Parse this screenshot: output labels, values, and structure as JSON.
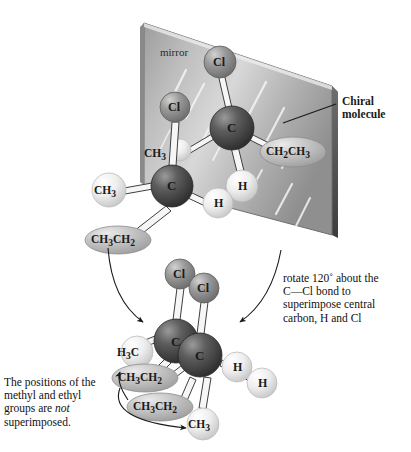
{
  "figure": {
    "mirror_label": "mirror",
    "chiral_label_line1": "Chiral",
    "chiral_label_line2": "molecule"
  },
  "annotations": {
    "rotate_note": "rotate 120˚ about the\nC—Cl bond to\nsuperimpose central\ncarbon, H and Cl",
    "not_superimposed_pre": "The positions of the\nmethyl and ethyl\ngroups are ",
    "not_superimposed_ital": "not",
    "not_superimposed_post": "\nsuperimposed."
  },
  "colors": {
    "carbon": "#4a4a4a",
    "carbon_light": "#8f8f8f",
    "chlorine": "#8a8a8a",
    "chlorine_light": "#c9c9c9",
    "hydrogen": "#e9e9e9",
    "hydrogen_light": "#ffffff",
    "group_ellipse": "#b6b6b6",
    "group_ellipse_light": "#e2e2e2",
    "mirror_dark": "#8d8d8d",
    "mirror_light": "#dcdcdc",
    "mirror_edge": "#4f4f4f",
    "bond": "#f2f2f2",
    "bond_outline": "#4a4a4a",
    "text": "#1a1a1a"
  },
  "top_molecule_left": {
    "name": "left-enantiomer",
    "atoms": [
      {
        "id": "cl",
        "label": "Cl",
        "kind": "chlorine",
        "cx": 175,
        "cy": 107,
        "r": 15
      },
      {
        "id": "c",
        "label": "C",
        "kind": "carbon",
        "cx": 172,
        "cy": 186,
        "r": 21
      },
      {
        "id": "ch3",
        "label": "CH3",
        "kind": "hydrogen",
        "cx": 109,
        "cy": 190,
        "r": 17
      },
      {
        "id": "h",
        "label": "H",
        "kind": "hydrogen",
        "cx": 218,
        "cy": 203,
        "r": 15
      }
    ],
    "groups": [
      {
        "id": "ch3-upper",
        "label": "CH3",
        "cx": 158,
        "cy": 153
      },
      {
        "id": "ch3ch2",
        "label": "CH3CH2",
        "cx": 118,
        "cy": 240
      }
    ]
  },
  "top_molecule_right": {
    "name": "right-enantiomer",
    "atoms": [
      {
        "id": "cl",
        "label": "Cl",
        "kind": "chlorine",
        "cx": 220,
        "cy": 62,
        "r": 16
      },
      {
        "id": "c",
        "label": "C",
        "kind": "carbon",
        "cx": 232,
        "cy": 128,
        "r": 22
      },
      {
        "id": "h",
        "label": "H",
        "kind": "hydrogen",
        "cx": 242,
        "cy": 186,
        "r": 16
      }
    ],
    "groups": [
      {
        "id": "ch2ch3",
        "label": "CH2CH3",
        "cx": 293,
        "cy": 152
      }
    ]
  },
  "bottom_molecules": {
    "name": "superimposed-pair",
    "atoms": [
      {
        "id": "cl-back",
        "label": "Cl",
        "kind": "chlorine",
        "cx": 180,
        "cy": 274,
        "r": 15
      },
      {
        "id": "cl-front",
        "label": "Cl",
        "kind": "chlorine",
        "cx": 204,
        "cy": 288,
        "r": 15
      },
      {
        "id": "c-back",
        "label": "C",
        "kind": "carbon",
        "cx": 176,
        "cy": 341,
        "r": 22
      },
      {
        "id": "c-front",
        "label": "C",
        "kind": "carbon",
        "cx": 200,
        "cy": 355,
        "r": 22
      },
      {
        "id": "h3c",
        "label": "H3C",
        "kind": "hydrogen",
        "cx": 137,
        "cy": 352,
        "r": 16
      },
      {
        "id": "h-a",
        "label": "H",
        "kind": "hydrogen",
        "cx": 237,
        "cy": 367,
        "r": 15
      },
      {
        "id": "h-b",
        "label": "H",
        "kind": "hydrogen",
        "cx": 262,
        "cy": 383,
        "r": 15
      },
      {
        "id": "ch3",
        "label": "CH3",
        "kind": "hydrogen",
        "cx": 203,
        "cy": 424,
        "r": 16
      }
    ],
    "groups": [
      {
        "id": "ch3ch2-upper",
        "label": "CH3CH2",
        "cx": 145,
        "cy": 378
      },
      {
        "id": "ch3ch2-lower",
        "label": "CH3CH2",
        "cx": 160,
        "cy": 407
      }
    ]
  },
  "labels": {
    "Cl": "Cl",
    "C": "C",
    "H": "H",
    "CH3": "CH3",
    "H3C": "H3C",
    "CH3CH2": "CH3CH2",
    "CH2CH3": "CH2CH3"
  }
}
